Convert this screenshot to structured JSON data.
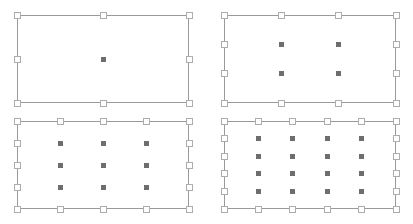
{
  "scene": {
    "title": "Selection handle grid demonstration",
    "background_color": "#ffffff",
    "width": 413,
    "height": 224
  },
  "style": {
    "rect_border_color": "#9a9a9a",
    "handle_fill_color": "#ffffff",
    "handle_border_color": "#adadad",
    "dot_color": "#6e6e6e",
    "handle_size_px": 7,
    "dot_size_px": 5
  },
  "panels": [
    {
      "name": "panel-top-left",
      "label": "1 x 1",
      "x": 17,
      "y": 15,
      "width": 172,
      "height": 88,
      "grid_cols": 1,
      "grid_rows": 1,
      "dot_count": 1,
      "handles_top": 3,
      "handles_left": 3
    },
    {
      "name": "panel-top-right",
      "label": "2 x 2",
      "x": 224,
      "y": 15,
      "width": 172,
      "height": 88,
      "grid_cols": 2,
      "grid_rows": 2,
      "dot_count": 4,
      "handles_top": 4,
      "handles_left": 4
    },
    {
      "name": "panel-bottom-left",
      "label": "3 x 3",
      "x": 17,
      "y": 121,
      "width": 172,
      "height": 88,
      "grid_cols": 3,
      "grid_rows": 3,
      "dot_count": 9,
      "handles_top": 5,
      "handles_left": 5
    },
    {
      "name": "panel-bottom-right",
      "label": "4 x 4",
      "x": 224,
      "y": 121,
      "width": 172,
      "height": 88,
      "grid_cols": 4,
      "grid_rows": 4,
      "dot_count": 16,
      "handles_top": 6,
      "handles_left": 6
    }
  ]
}
